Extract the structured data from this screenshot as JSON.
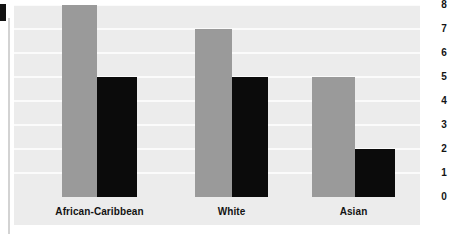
{
  "chart_data": {
    "type": "bar",
    "title": "",
    "subtitle": "",
    "xlabel": "",
    "ylabel": "",
    "categories": [
      "African-Caribbean",
      "White",
      "Asian"
    ],
    "series": [
      {
        "name": "series-1",
        "color": "#9a9a9a",
        "values": [
          8,
          7,
          5
        ]
      },
      {
        "name": "series-2",
        "color": "#0b0b0b",
        "values": [
          5,
          5,
          2
        ]
      }
    ],
    "ylim": [
      0,
      8
    ],
    "yticks": [
      0,
      1,
      2,
      3,
      4,
      5,
      6,
      7,
      8
    ],
    "ytick_labels": [
      "0",
      "1",
      "2",
      "3",
      "4",
      "5",
      "6",
      "7",
      "8"
    ],
    "y_axis_position": "right",
    "grid": true,
    "grid_color": "#fbfbfb",
    "legend": "none",
    "plot_background": "#ececec",
    "figure_background": "#ffffff"
  }
}
